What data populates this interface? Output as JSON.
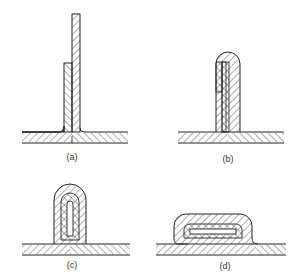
{
  "figure": {
    "panels": [
      {
        "id": "a",
        "label": "(a)"
      },
      {
        "id": "b",
        "label": "(b)"
      },
      {
        "id": "c",
        "label": "(c)"
      },
      {
        "id": "d",
        "label": "(d)"
      }
    ],
    "line_color": "#222222",
    "background": "#ffffff"
  }
}
